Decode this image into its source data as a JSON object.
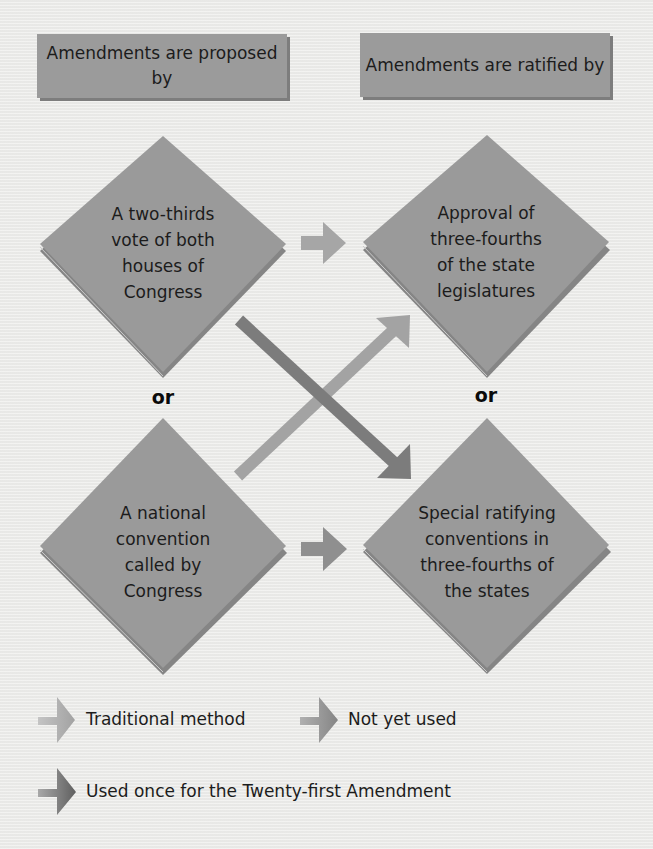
{
  "headers": {
    "proposed": "Amendments are proposed by",
    "ratified": "Amendments are ratified by"
  },
  "proposal_methods": [
    {
      "lines": [
        "A two-thirds",
        "vote of both",
        "houses of",
        "Congress"
      ]
    },
    {
      "lines": [
        "A national",
        "convention",
        "called by",
        "Congress"
      ]
    }
  ],
  "ratification_methods": [
    {
      "lines": [
        "Approval of",
        "three-fourths",
        "of the state",
        "legislatures"
      ]
    },
    {
      "lines": [
        "Special ratifying",
        "conventions in",
        "three-fourths of",
        "the states"
      ]
    }
  ],
  "connectors": {
    "or_left": "or",
    "or_right": "or"
  },
  "legend": [
    {
      "label": "Traditional method",
      "arrow": "arrow-right-light",
      "color": "#a8a8a8"
    },
    {
      "label": "Not yet used",
      "arrow": "arrow-right-medium",
      "color": "#8e8e8e"
    },
    {
      "label": "Used once for the Twenty-first Amendment",
      "arrow": "arrow-right-dark",
      "color": "#6e6e6e"
    }
  ],
  "colors": {
    "diamond": "#999999",
    "diamond_shadow": "#7f7f7f",
    "header_box": "#9b9b9b",
    "arrow_traditional": "#a8a8a8",
    "arrow_not_used": "#8e8e8e",
    "arrow_used_once": "#6e6e6e",
    "background": "#ececea"
  }
}
